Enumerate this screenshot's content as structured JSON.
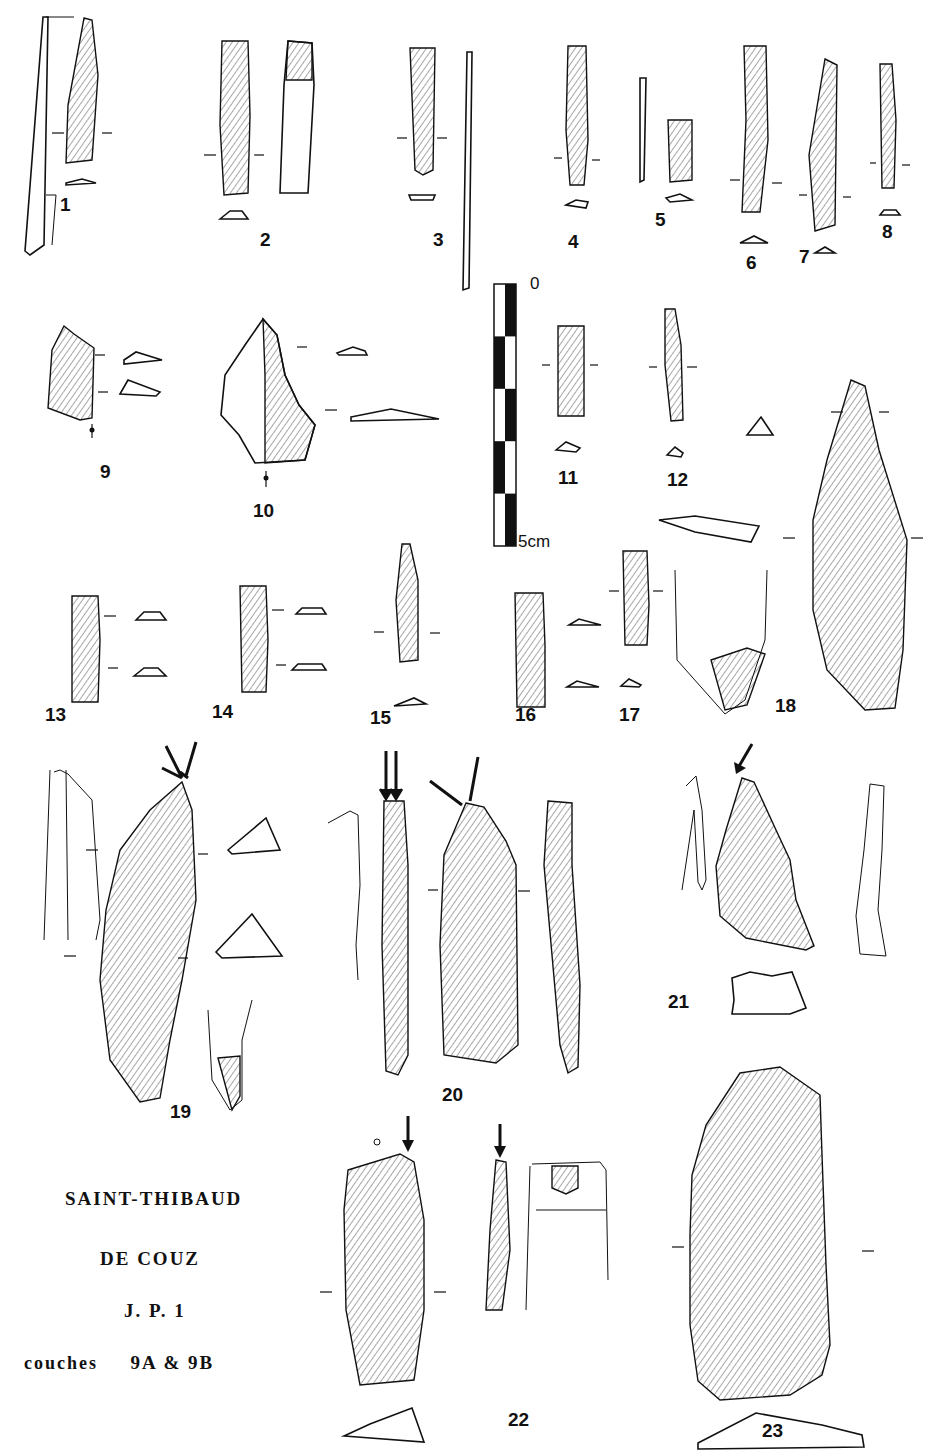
{
  "plate": {
    "caption": {
      "line1": "SAINT-THIBAUD",
      "line2": "DE  COUZ",
      "line3": "J. P. 1",
      "line4_prefix": "couches",
      "line4_value": "9A & 9B"
    },
    "scale_bar": {
      "start_label": "0",
      "end_label": "5cm",
      "segments": 5,
      "units": "cm"
    },
    "figures": [
      {
        "id": "1",
        "label": "1"
      },
      {
        "id": "2",
        "label": "2"
      },
      {
        "id": "3",
        "label": "3"
      },
      {
        "id": "4",
        "label": "4"
      },
      {
        "id": "5",
        "label": "5"
      },
      {
        "id": "6",
        "label": "6"
      },
      {
        "id": "7",
        "label": "7"
      },
      {
        "id": "8",
        "label": "8"
      },
      {
        "id": "9",
        "label": "9"
      },
      {
        "id": "10",
        "label": "10"
      },
      {
        "id": "11",
        "label": "11"
      },
      {
        "id": "12",
        "label": "12"
      },
      {
        "id": "13",
        "label": "13"
      },
      {
        "id": "14",
        "label": "14"
      },
      {
        "id": "15",
        "label": "15"
      },
      {
        "id": "16",
        "label": "16"
      },
      {
        "id": "17",
        "label": "17"
      },
      {
        "id": "18",
        "label": "18"
      },
      {
        "id": "19",
        "label": "19"
      },
      {
        "id": "20",
        "label": "20"
      },
      {
        "id": "21",
        "label": "21"
      },
      {
        "id": "22",
        "label": "22"
      },
      {
        "id": "23",
        "label": "23"
      }
    ]
  }
}
